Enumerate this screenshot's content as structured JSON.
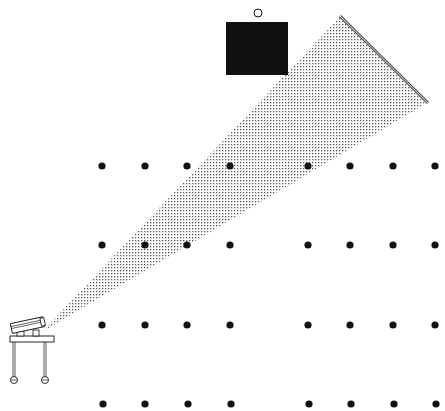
{
  "diagram": {
    "colors": {
      "background": "#ffffff",
      "ink": "#111111",
      "beam_dot": "#555555",
      "screen_line": "#555555"
    },
    "projector": {
      "cart": {
        "x": 10,
        "y": 336,
        "width": 44,
        "height": 6
      },
      "legs": [
        {
          "x": 14,
          "y1": 342,
          "y2": 377
        },
        {
          "x": 45,
          "y1": 342,
          "y2": 377
        }
      ],
      "wheels": [
        {
          "cx": 14,
          "cy": 380,
          "r": 3.5
        },
        {
          "cx": 45,
          "cy": 380,
          "r": 3.5
        }
      ],
      "lens": {
        "x": 42,
        "y": 332
      }
    },
    "beam": {
      "apex": [
        42,
        332
      ],
      "far_top": [
        340,
        17
      ],
      "far_bottom": [
        427,
        103
      ]
    },
    "screen": {
      "x1": 340,
      "y1": 16,
      "x2": 428,
      "y2": 103
    },
    "speaker_box": {
      "x": 226,
      "y": 22,
      "width": 62,
      "height": 53
    },
    "speaker_indicator": {
      "cx": 258,
      "cy": 13,
      "r": 4
    },
    "seats": {
      "radius": 3.6,
      "rows": [
        {
          "y": 166,
          "x": [
            102,
            145,
            187,
            230,
            308,
            350,
            393,
            435
          ]
        },
        {
          "y": 245,
          "x": [
            102,
            145,
            187,
            230,
            308,
            350,
            393,
            435
          ]
        },
        {
          "y": 325,
          "x": [
            102,
            145,
            187,
            230,
            308,
            350,
            393,
            435
          ]
        },
        {
          "y": 404,
          "x": [
            103,
            145,
            188,
            231,
            309,
            351,
            394,
            436
          ]
        }
      ]
    }
  }
}
